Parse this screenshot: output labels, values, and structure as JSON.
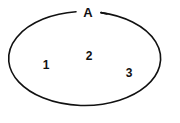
{
  "diagram": {
    "kind": "set-diagram",
    "background_color": "#ffffff",
    "stroke_color": "#111111",
    "text_color": "#111111",
    "set": {
      "name": "set-a",
      "label": "A",
      "label_position": "top-break",
      "label_x": 88,
      "label_y": 14,
      "shape": "ellipse",
      "center_x": 90,
      "center_y": 58,
      "radius_x": 76,
      "radius_y": 47,
      "gap_start_x": 76,
      "gap_end_x": 101
    },
    "elements": [
      {
        "name": "element-1",
        "label": "1",
        "x": 46,
        "y": 66
      },
      {
        "name": "element-2",
        "label": "2",
        "x": 89,
        "y": 57
      },
      {
        "name": "element-3",
        "label": "3",
        "x": 129,
        "y": 74
      }
    ]
  }
}
